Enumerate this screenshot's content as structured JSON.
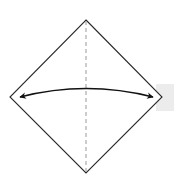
{
  "diagram": {
    "type": "origami-fold-step",
    "shape": "square rotated 45° (diamond)",
    "fold_line": "vertical valley fold (dashed) through center",
    "arrow": "curved double-headed arrow from left corner to right corner",
    "colors": {
      "outline": "#2a2a2a",
      "fold_line": "#9a9a9a",
      "arrow": "#111111",
      "background": "#ffffff",
      "side_block": "#ececec"
    }
  }
}
